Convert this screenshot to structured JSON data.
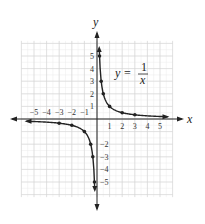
{
  "chart_data": {
    "type": "line",
    "title": "",
    "xlabel": "x",
    "ylabel": "y",
    "equation": {
      "lhs": "y =",
      "numerator": "1",
      "denominator": "x"
    },
    "xlim": [
      -6,
      6
    ],
    "ylim": [
      -6,
      6
    ],
    "grid": true,
    "x_ticks": [
      -5,
      -4,
      -3,
      -2,
      -1,
      1,
      2,
      3,
      4,
      5
    ],
    "y_ticks": [
      -5,
      -4,
      -3,
      -2,
      1,
      2,
      3,
      4,
      5
    ],
    "x_tick_labels": [
      "−5",
      "−4",
      "−3",
      "−2",
      "−1",
      "1",
      "2",
      "3",
      "4",
      "5"
    ],
    "y_tick_labels": [
      "−5",
      "−4",
      "−3",
      "−2",
      "1",
      "2",
      "3",
      "4",
      "5"
    ],
    "series": [
      {
        "name": "y = 1/x (x > 0)",
        "points": [
          [
            0.2,
            5
          ],
          [
            0.333,
            3
          ],
          [
            0.5,
            2
          ],
          [
            1,
            1
          ],
          [
            2,
            0.5
          ],
          [
            3,
            0.333
          ],
          [
            5.5,
            0.18
          ]
        ]
      },
      {
        "name": "y = 1/x (x < 0)",
        "points": [
          [
            -5.5,
            -0.18
          ],
          [
            -3,
            -0.333
          ],
          [
            -2,
            -0.5
          ],
          [
            -1,
            -1
          ],
          [
            -0.5,
            -2
          ],
          [
            -0.333,
            -3
          ],
          [
            -0.2,
            -5
          ]
        ]
      }
    ],
    "markers": [
      [
        0.2,
        5
      ],
      [
        0.333,
        3
      ],
      [
        0.5,
        2
      ],
      [
        1,
        1
      ],
      [
        2,
        0.5
      ],
      [
        3,
        0.333
      ],
      [
        -3,
        -0.333
      ],
      [
        -2,
        -0.5
      ],
      [
        -1,
        -1
      ],
      [
        -0.5,
        -2
      ],
      [
        -0.333,
        -3
      ],
      [
        -0.2,
        -5
      ]
    ]
  }
}
